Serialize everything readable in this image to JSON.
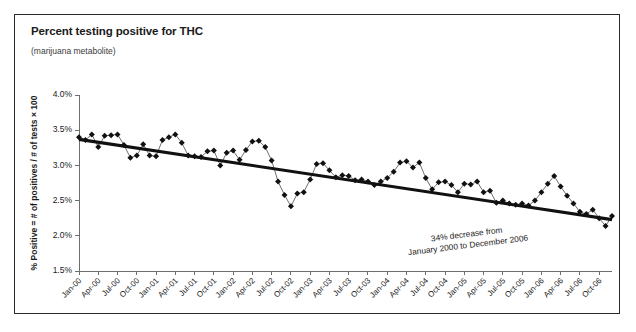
{
  "figure": {
    "title": "Percent testing positive for THC",
    "subtitle": "(marijuana metabolite)",
    "border_color": "#2b2b2b",
    "background": "#ffffff"
  },
  "chart_data": {
    "type": "line",
    "title": "Percent testing positive for THC",
    "subtitle": "(marijuana metabolite)",
    "xlabel": "",
    "ylabel": "% Positive = # of positives / # of tests × 100",
    "ylim": [
      1.5,
      4.0
    ],
    "ytick_values": [
      1.5,
      2.0,
      2.5,
      3.0,
      3.5,
      4.0
    ],
    "ytick_labels": [
      "1.5%",
      "2.0%",
      "2.5%",
      "3.0%",
      "3.5%",
      "4.0%"
    ],
    "grid": false,
    "legend": "none",
    "marker": "diamond",
    "series_color": "#111111",
    "x_tick_labels": [
      "Jan-00",
      "Apr-00",
      "Jul-00",
      "Oct-00",
      "Jan-01",
      "Apr-01",
      "Jul-01",
      "Oct-01",
      "Jan-02",
      "Apr-02",
      "Jul-02",
      "Oct-02",
      "Jan-03",
      "Apr-03",
      "Jul-03",
      "Oct-03",
      "Jan-04",
      "Apr-04",
      "Jul-04",
      "Oct-04",
      "Jan-05",
      "Apr-05",
      "Jul-05",
      "Oct-05",
      "Jan-06",
      "Apr-06",
      "Jul-06",
      "Oct-06"
    ],
    "x_tick_indices": [
      0,
      3,
      6,
      9,
      12,
      15,
      18,
      21,
      24,
      27,
      30,
      33,
      36,
      39,
      42,
      45,
      48,
      51,
      54,
      57,
      60,
      63,
      66,
      69,
      72,
      75,
      78,
      81
    ],
    "x_month_labels": [
      "Jan-00",
      "Feb-00",
      "Mar-00",
      "Apr-00",
      "May-00",
      "Jun-00",
      "Jul-00",
      "Aug-00",
      "Sep-00",
      "Oct-00",
      "Nov-00",
      "Dec-00",
      "Jan-01",
      "Feb-01",
      "Mar-01",
      "Apr-01",
      "May-01",
      "Jun-01",
      "Jul-01",
      "Aug-01",
      "Sep-01",
      "Oct-01",
      "Nov-01",
      "Dec-01",
      "Jan-02",
      "Feb-02",
      "Mar-02",
      "Apr-02",
      "May-02",
      "Jun-02",
      "Jul-02",
      "Aug-02",
      "Sep-02",
      "Oct-02",
      "Nov-02",
      "Dec-02",
      "Jan-03",
      "Feb-03",
      "Mar-03",
      "Apr-03",
      "May-03",
      "Jun-03",
      "Jul-03",
      "Aug-03",
      "Sep-03",
      "Oct-03",
      "Nov-03",
      "Dec-03",
      "Jan-04",
      "Feb-04",
      "Mar-04",
      "Apr-04",
      "May-04",
      "Jun-04",
      "Jul-04",
      "Aug-04",
      "Sep-04",
      "Oct-04",
      "Nov-04",
      "Dec-04",
      "Jan-05",
      "Feb-05",
      "Mar-05",
      "Apr-05",
      "May-05",
      "Jun-05",
      "Jul-05",
      "Aug-05",
      "Sep-05",
      "Oct-05",
      "Nov-05",
      "Dec-05",
      "Jan-06",
      "Feb-06",
      "Mar-06",
      "Apr-06",
      "May-06",
      "Jun-06",
      "Jul-06",
      "Aug-06",
      "Sep-06",
      "Oct-06",
      "Nov-06",
      "Dec-06"
    ],
    "values": [
      3.4,
      3.36,
      3.44,
      3.26,
      3.42,
      3.43,
      3.44,
      3.29,
      3.11,
      3.14,
      3.3,
      3.14,
      3.13,
      3.36,
      3.4,
      3.44,
      3.32,
      3.14,
      3.13,
      3.12,
      3.2,
      3.21,
      3.0,
      3.18,
      3.21,
      3.08,
      3.22,
      3.34,
      3.35,
      3.26,
      3.07,
      2.77,
      2.58,
      2.42,
      2.6,
      2.62,
      2.8,
      3.02,
      3.03,
      2.93,
      2.83,
      2.86,
      2.85,
      2.79,
      2.8,
      2.77,
      2.72,
      2.77,
      2.82,
      2.91,
      3.04,
      3.06,
      2.97,
      3.04,
      2.82,
      2.66,
      2.76,
      2.77,
      2.72,
      2.62,
      2.74,
      2.73,
      2.77,
      2.62,
      2.64,
      2.47,
      2.5,
      2.46,
      2.44,
      2.46,
      2.43,
      2.5,
      2.62,
      2.74,
      2.85,
      2.7,
      2.57,
      2.46,
      2.34,
      2.31,
      2.37,
      2.25,
      2.14,
      2.28
    ],
    "trend_line": {
      "start_value": 3.37,
      "end_value": 2.23,
      "start_index": 0,
      "end_index": 83
    },
    "annotation": {
      "line1": "34% decrease from",
      "line2": "January 2000 to December 2006",
      "rotation_deg": -7
    }
  }
}
